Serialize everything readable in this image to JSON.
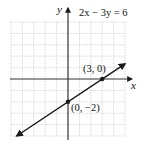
{
  "chart_data": {
    "type": "line",
    "title": "2x − 3y = 6",
    "equation": "2x − 3y = 6",
    "xlabel": "x",
    "ylabel": "y",
    "xlim": [
      -5,
      5
    ],
    "ylim": [
      -5,
      5
    ],
    "grid": true,
    "series": [
      {
        "name": "2x − 3y = 6",
        "x": [
          -4.5,
          0,
          3,
          5
        ],
        "y": [
          -5,
          -2,
          0,
          1.33
        ]
      }
    ],
    "points": [
      {
        "x": 3,
        "y": 0,
        "label": "(3, 0)"
      },
      {
        "x": 0,
        "y": -2,
        "label": "(0, −2)"
      }
    ]
  },
  "labels": {
    "equation": "2x − 3y = 6",
    "x_axis": "x",
    "y_axis": "y",
    "point_x_intercept": "(3, 0)",
    "point_y_intercept": "(0, −2)"
  },
  "colors": {
    "grid": "#b8b8b8",
    "axis": "#222222",
    "line": "#1a1a1a"
  }
}
